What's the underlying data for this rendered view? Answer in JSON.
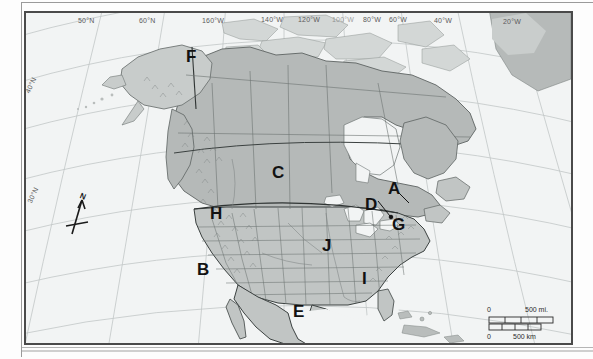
{
  "map": {
    "title_visible": false,
    "projection_hint": "conic",
    "frame": {
      "border_color": "#4a4a4a",
      "ocean_color": "#f2f4f4"
    },
    "colors": {
      "land_light": "#d6d9d8",
      "land_mid": "#b9bdbc",
      "land_dark": "#a4a9a8",
      "ocean": "#f2f4f4",
      "graticule": "#b9bebe",
      "border_line": "#5d6362",
      "country_line": "#2f3433"
    },
    "graticule_labels": [
      {
        "id": "lat-50n",
        "text": "50°N",
        "x": 52,
        "y": 15,
        "rotate": 0
      },
      {
        "id": "lat-60n",
        "text": "60°N",
        "x": 113,
        "y": 15,
        "rotate": 0
      },
      {
        "id": "lon-160w",
        "text": "160°W",
        "x": 176,
        "y": 15,
        "rotate": 0
      },
      {
        "id": "lon-140w",
        "text": "140°W",
        "x": 235,
        "y": 14,
        "rotate": 0
      },
      {
        "id": "lon-120w",
        "text": "120°W",
        "x": 272,
        "y": 14,
        "rotate": 0
      },
      {
        "id": "lon-100w",
        "text": "100°W",
        "x": 308,
        "y": 14,
        "rotate": 0
      },
      {
        "id": "lon-80w",
        "text": "80°W",
        "x": 337,
        "y": 14,
        "rotate": 0
      },
      {
        "id": "lon-60w",
        "text": "60°W",
        "x": 363,
        "y": 14,
        "rotate": 0
      },
      {
        "id": "lon-40w",
        "text": "40°W",
        "x": 408,
        "y": 15,
        "rotate": 0
      },
      {
        "id": "lon-20w",
        "text": "20°W",
        "x": 477,
        "y": 16,
        "rotate": 0
      },
      {
        "id": "lat-40n",
        "text": "40°N",
        "x": 20,
        "y": 86,
        "rotate": -64
      },
      {
        "id": "lat-30n",
        "text": "30°N",
        "x": 22,
        "y": 196,
        "rotate": -64
      }
    ],
    "region_letters": [
      {
        "id": "label-F",
        "text": "F",
        "x": 184,
        "y": 46
      },
      {
        "id": "label-C",
        "text": "C",
        "x": 270,
        "y": 162
      },
      {
        "id": "label-A",
        "text": "A",
        "x": 386,
        "y": 178
      },
      {
        "id": "label-D",
        "text": "D",
        "x": 363,
        "y": 194
      },
      {
        "id": "label-G",
        "text": "G",
        "x": 390,
        "y": 214
      },
      {
        "id": "label-H",
        "text": "H",
        "x": 208,
        "y": 203
      },
      {
        "id": "label-J",
        "text": "J",
        "x": 320,
        "y": 235
      },
      {
        "id": "label-B",
        "text": "B",
        "x": 195,
        "y": 259
      },
      {
        "id": "label-I",
        "text": "I",
        "x": 358,
        "y": 268
      },
      {
        "id": "label-E",
        "text": "E",
        "x": 291,
        "y": 301
      }
    ],
    "compass": {
      "label": "N",
      "orientation_deg": 22
    },
    "scale_bar": {
      "miles_zero": "0",
      "miles_value": "500 mi.",
      "km_zero": "0",
      "km_value": "500 km"
    }
  }
}
